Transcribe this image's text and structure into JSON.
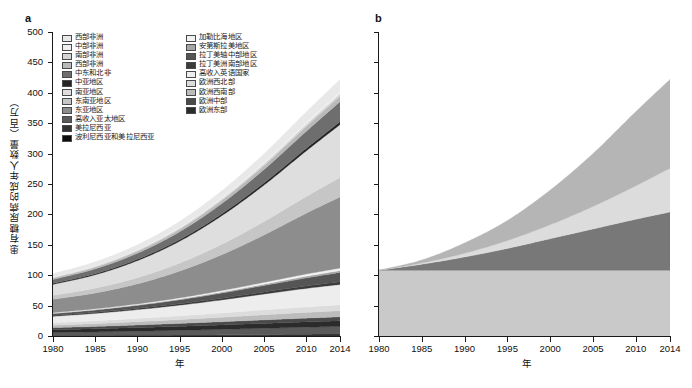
{
  "figure": {
    "panels": [
      {
        "label": "a",
        "xlabel": "年",
        "ylabel": "患有糖尿病的成年人数量（百万）",
        "yticks": [
          "0",
          "50",
          "100",
          "150",
          "200",
          "250",
          "300",
          "350",
          "400",
          "450",
          "500"
        ],
        "xticks": [
          "1980",
          "1985",
          "1990",
          "1995",
          "2000",
          "2005",
          "2010",
          "2014"
        ]
      },
      {
        "label": "b",
        "xlabel": "年",
        "ylabel": "",
        "yticks": [
          "",
          "",
          "",
          "",
          "",
          "",
          "",
          "",
          "",
          "",
          ""
        ],
        "xticks": [
          "1980",
          "1985",
          "1990",
          "1995",
          "2000",
          "2005",
          "2010",
          "2014"
        ]
      }
    ]
  },
  "legend_a_col1": [
    {
      "label": "西部非洲",
      "color": "#e8e8e8"
    },
    {
      "label": "中部非洲",
      "color": "#efefef"
    },
    {
      "label": "南部非洲",
      "color": "#d4d4d4"
    },
    {
      "label": "西部非洲",
      "color": "#b9b9b9"
    },
    {
      "label": "中东和北非",
      "color": "#6e6e6e"
    },
    {
      "label": "中亚地区",
      "color": "#242424"
    },
    {
      "label": "南亚地区",
      "color": "#dedede"
    },
    {
      "label": "东南亚地区",
      "color": "#c6c6c6"
    },
    {
      "label": "东亚地区",
      "color": "#8d8d8d"
    },
    {
      "label": "高收入亚太地区",
      "color": "#5a5a5a"
    },
    {
      "label": "美拉尼西亚",
      "color": "#333333"
    },
    {
      "label": "波利尼西亚和美拉尼西亚",
      "color": "#0d0d0d"
    }
  ],
  "legend_a_col2": [
    {
      "label": "加勒比海地区",
      "color": "#f2f2f2"
    },
    {
      "label": "安第斯拉美地区",
      "color": "#a5a5a5"
    },
    {
      "label": "拉丁美轴中部地区",
      "color": "#555555"
    },
    {
      "label": "拉丁美洲南部地区",
      "color": "#3b3b3b"
    },
    {
      "label": "高收入英语国家",
      "color": "#ededed"
    },
    {
      "label": "欧洲西北部",
      "color": "#dcdcdc"
    },
    {
      "label": "欧洲西南部",
      "color": "#bcbcbc"
    },
    {
      "label": "欧洲中部",
      "color": "#4a4a4a"
    },
    {
      "label": "欧洲东部",
      "color": "#2b2b2b"
    }
  ],
  "legend_b": [
    {
      "label": "由于流行率的变化而产生的变化",
      "color": "#b5b5b5"
    },
    {
      "label": "由于流行率的变化与人口规模和年龄结构的变化之间的相互作用而产生的变化",
      "color": "#dcdcdc"
    },
    {
      "label": "由于人口规模和年龄结构的变化而产生的变化",
      "color": "#787878"
    },
    {
      "label": "1980 年患有糖尿病的成年人数量",
      "color": "#c9c9c9"
    }
  ],
  "chart_data": [
    {
      "type": "area",
      "panel": "a",
      "title": "",
      "xlabel": "年",
      "ylabel": "患有糖尿病的成年人数量（百万）",
      "xlim": [
        1980,
        2014
      ],
      "ylim": [
        0,
        500
      ],
      "grid": false,
      "legend_position": "inside-top-left",
      "x": [
        1980,
        1985,
        1990,
        1995,
        2000,
        2005,
        2010,
        2014
      ],
      "total": [
        108,
        125,
        153,
        190,
        240,
        300,
        369,
        422
      ],
      "series": [
        {
          "name": "波利尼西亚和美拉尼西亚",
          "color": "#0d0d0d",
          "values": [
            0.3,
            0.4,
            0.5,
            0.6,
            0.8,
            1.0,
            1.2,
            1.4
          ]
        },
        {
          "name": "美拉尼西亚",
          "color": "#333333",
          "values": [
            0.4,
            0.5,
            0.7,
            0.9,
            1.1,
            1.4,
            1.8,
            2.1
          ]
        },
        {
          "name": "高收入亚太地区",
          "color": "#5a5a5a",
          "values": [
            5.0,
            5.8,
            6.7,
            7.8,
            9.0,
            10.3,
            11.5,
            12.3
          ]
        },
        {
          "name": "欧洲东部",
          "color": "#2b2b2b",
          "values": [
            4.6,
            5.2,
            5.9,
            6.6,
            7.3,
            8.0,
            8.7,
            9.2
          ]
        },
        {
          "name": "欧洲中部",
          "color": "#4a4a4a",
          "values": [
            3.4,
            3.8,
            4.3,
            4.8,
            5.3,
            5.8,
            6.2,
            6.5
          ]
        },
        {
          "name": "欧洲西南部",
          "color": "#bcbcbc",
          "values": [
            4.0,
            4.6,
            5.4,
            6.3,
            7.3,
            8.4,
            9.4,
            10.1
          ]
        },
        {
          "name": "欧洲西北部",
          "color": "#dcdcdc",
          "values": [
            4.2,
            4.7,
            5.4,
            6.2,
            7.1,
            8.1,
            9.0,
            9.6
          ]
        },
        {
          "name": "高收入英语国家",
          "color": "#ededed",
          "values": [
            10.5,
            12.2,
            14.5,
            17.5,
            21.5,
            26.0,
            30.5,
            33.5
          ]
        },
        {
          "name": "拉丁美洲南部地区",
          "color": "#3b3b3b",
          "values": [
            1.4,
            1.7,
            2.0,
            2.4,
            2.9,
            3.4,
            4.0,
            4.4
          ]
        },
        {
          "name": "拉丁美轴中部地区",
          "color": "#555555",
          "values": [
            3.0,
            3.8,
            4.9,
            6.4,
            8.3,
            10.6,
            13.2,
            15.3
          ]
        },
        {
          "name": "安第斯拉美地区",
          "color": "#a5a5a5",
          "values": [
            0.6,
            0.8,
            1.0,
            1.3,
            1.7,
            2.2,
            2.8,
            3.2
          ]
        },
        {
          "name": "加勒比海地区",
          "color": "#f2f2f2",
          "values": [
            1.0,
            1.2,
            1.5,
            1.9,
            2.4,
            3.0,
            3.6,
            4.1
          ]
        },
        {
          "name": "东亚地区",
          "color": "#8d8d8d",
          "values": [
            22.0,
            26.0,
            33.0,
            44.0,
            59.0,
            78.0,
            100.0,
            117.0
          ]
        },
        {
          "name": "东南亚地区",
          "color": "#c6c6c6",
          "values": [
            6.5,
            8.0,
            10.2,
            13.2,
            17.2,
            22.0,
            27.5,
            32.0
          ]
        },
        {
          "name": "南亚地区",
          "color": "#dedede",
          "values": [
            18.0,
            22.0,
            28.0,
            36.0,
            47.0,
            60.0,
            75.0,
            87.0
          ]
        },
        {
          "name": "中亚地区",
          "color": "#242424",
          "values": [
            1.5,
            1.8,
            2.1,
            2.5,
            3.0,
            3.6,
            4.2,
            4.7
          ]
        },
        {
          "name": "中东和北非",
          "color": "#6e6e6e",
          "values": [
            6.5,
            8.0,
            10.0,
            13.0,
            17.0,
            22.0,
            28.0,
            33.0
          ]
        },
        {
          "name": "西部非洲",
          "color": "#b9b9b9",
          "values": [
            2.4,
            2.9,
            3.5,
            4.3,
            5.3,
            6.6,
            8.1,
            9.3
          ]
        },
        {
          "name": "南部非洲",
          "color": "#d4d4d4",
          "values": [
            1.1,
            1.3,
            1.6,
            2.0,
            2.4,
            2.9,
            3.5,
            3.9
          ]
        },
        {
          "name": "中部非洲",
          "color": "#efefef",
          "values": [
            0.9,
            1.1,
            1.4,
            1.7,
            2.1,
            2.6,
            3.2,
            3.7
          ]
        },
        {
          "name": "西部非洲",
          "color": "#e8e8e8",
          "values": [
            5.2,
            6.2,
            7.5,
            9.2,
            11.3,
            13.9,
            17.1,
            19.7
          ]
        }
      ]
    },
    {
      "type": "area",
      "panel": "b",
      "title": "",
      "xlabel": "年",
      "ylabel": "",
      "xlim": [
        1980,
        2014
      ],
      "ylim": [
        0,
        500
      ],
      "grid": false,
      "legend_position": "inside-top-left",
      "x": [
        1980,
        1985,
        1990,
        1995,
        2000,
        2005,
        2010,
        2014
      ],
      "series": [
        {
          "name": "1980 年患有糖尿病的成年人数量",
          "color": "#c9c9c9",
          "values": [
            108,
            108,
            108,
            108,
            108,
            108,
            108,
            108
          ]
        },
        {
          "name": "由于人口规模和年龄结构的变化而产生的变化",
          "color": "#787878",
          "values": [
            0,
            10,
            22,
            36,
            52,
            68,
            84,
            96
          ]
        },
        {
          "name": "由于流行率的变化与人口规模和年龄结构的变化之间的相互作用而产生的变化",
          "color": "#dcdcdc",
          "values": [
            0,
            2,
            6,
            13,
            23,
            37,
            55,
            72
          ]
        },
        {
          "name": "由于流行率的变化而产生的变化",
          "color": "#b5b5b5",
          "values": [
            0,
            5,
            17,
            33,
            57,
            87,
            122,
            146
          ]
        }
      ]
    }
  ]
}
